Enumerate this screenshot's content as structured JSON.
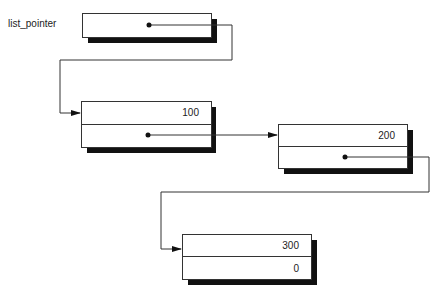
{
  "diagram": {
    "type": "linked-list",
    "head_label": "list_pointer",
    "nodes": [
      {
        "id": "head",
        "data": "",
        "link": "dot"
      },
      {
        "id": "node1",
        "data": "100",
        "link": "dot"
      },
      {
        "id": "node2",
        "data": "200",
        "link": "dot"
      },
      {
        "id": "node3",
        "data": "300",
        "link": "0"
      }
    ],
    "edges": [
      {
        "from": "head",
        "to": "node1"
      },
      {
        "from": "node1",
        "to": "node2"
      },
      {
        "from": "node2",
        "to": "node3"
      }
    ],
    "colors": {
      "line": "#333333",
      "shadow": "#111111",
      "background": "#ffffff"
    }
  }
}
